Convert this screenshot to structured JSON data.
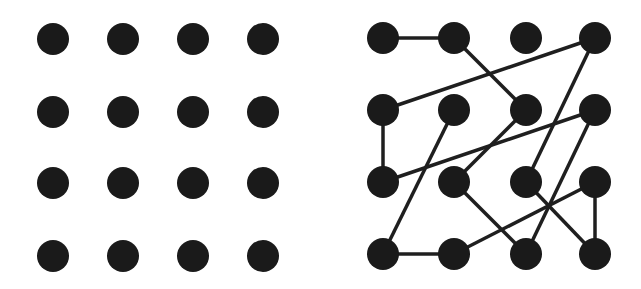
{
  "colors": {
    "background": "#ffffff",
    "dot": "#1a1a1a",
    "edge": "#1f1f1f"
  },
  "dot_radius": 16,
  "edge_width": 3.5,
  "left_grid": {
    "xs": [
      53,
      123,
      193,
      263
    ],
    "ys": [
      39,
      112,
      183,
      256
    ]
  },
  "right_grid": {
    "xs": [
      383,
      454,
      526,
      595
    ],
    "ys": [
      38,
      110,
      182,
      254
    ],
    "edges": [
      [
        [
          0,
          0
        ],
        [
          1,
          0
        ]
      ],
      [
        [
          1,
          0
        ],
        [
          2,
          1
        ]
      ],
      [
        [
          3,
          0
        ],
        [
          0,
          1
        ]
      ],
      [
        [
          3,
          0
        ],
        [
          2,
          2
        ]
      ],
      [
        [
          0,
          1
        ],
        [
          0,
          2
        ]
      ],
      [
        [
          1,
          1
        ],
        [
          0,
          3
        ]
      ],
      [
        [
          2,
          1
        ],
        [
          1,
          2
        ]
      ],
      [
        [
          3,
          1
        ],
        [
          0,
          2
        ]
      ],
      [
        [
          3,
          1
        ],
        [
          2,
          3
        ]
      ],
      [
        [
          2,
          2
        ],
        [
          3,
          3
        ]
      ],
      [
        [
          3,
          2
        ],
        [
          3,
          3
        ]
      ],
      [
        [
          3,
          2
        ],
        [
          1,
          3
        ]
      ],
      [
        [
          1,
          2
        ],
        [
          2,
          3
        ]
      ],
      [
        [
          0,
          3
        ],
        [
          1,
          3
        ]
      ]
    ]
  }
}
